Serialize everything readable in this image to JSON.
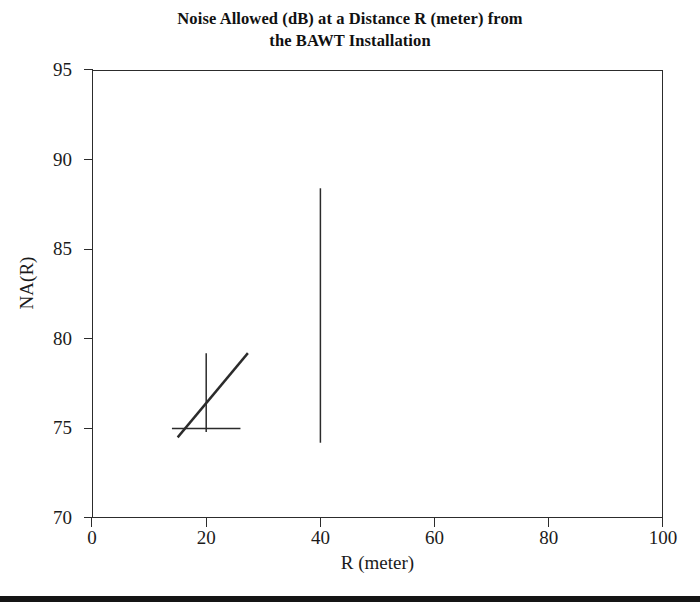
{
  "figure": {
    "title_lines": [
      "Noise Allowed (dB) at a Distance R (meter) from",
      "the BAWT Installation"
    ],
    "bottom_rule": true
  },
  "chart_data": {
    "type": "line",
    "title": "Noise Allowed (dB) at a Distance R (meter) from the BAWT Installation",
    "xlabel": "R   (meter)",
    "ylabel": "NA(R)",
    "xlim": [
      0,
      100
    ],
    "ylim": [
      70,
      95
    ],
    "xticks": [
      0,
      20,
      40,
      60,
      80,
      100
    ],
    "yticks": [
      70,
      75,
      80,
      85,
      90,
      95
    ],
    "xtick_labels": [
      "0",
      "20",
      "40",
      "60",
      "80",
      "100"
    ],
    "ytick_labels": [
      "70",
      "75",
      "80",
      "85",
      "90",
      "95"
    ],
    "grid": false,
    "legend": null,
    "series": [
      {
        "name": "na-curve",
        "kind": "line",
        "points": [
          [
            15.0,
            74.5
          ],
          [
            27.3,
            79.2
          ]
        ]
      },
      {
        "name": "vertical-marker-20",
        "kind": "line",
        "points": [
          [
            20.0,
            74.8
          ],
          [
            20.0,
            79.2
          ]
        ]
      },
      {
        "name": "horizontal-marker-75",
        "kind": "line",
        "points": [
          [
            14.0,
            75.0
          ],
          [
            26.0,
            75.0
          ]
        ]
      },
      {
        "name": "vertical-marker-40",
        "kind": "line",
        "points": [
          [
            40.0,
            74.2
          ],
          [
            40.0,
            88.4
          ]
        ]
      }
    ],
    "line_color": "#2b2b2b"
  }
}
